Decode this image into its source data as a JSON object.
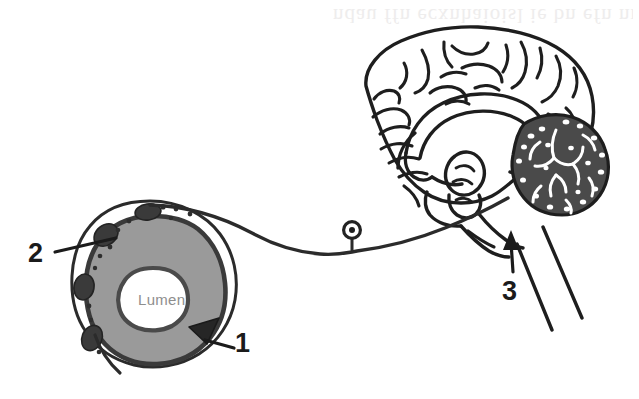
{
  "figure": {
    "type": "anatomical-line-diagram",
    "width": 639,
    "height": 399,
    "background_color": "#ffffff"
  },
  "labels": [
    {
      "id": "1",
      "text": "1",
      "refers_to": "parafollicular-cell-wedge-in-follicle-wall",
      "position": {
        "x": 235,
        "y": 330
      },
      "leader": "short line from dark triangular wedge at lower-right of follicle"
    },
    {
      "id": "2",
      "text": "2",
      "refers_to": "dark-cells-on-outer-follicle-membrane",
      "position": {
        "x": 28,
        "y": 240
      },
      "leader": "horizontal line to upper-left rim of follicle"
    },
    {
      "id": "3",
      "text": "3",
      "refers_to": "brainstem-axon-entry-point",
      "position": {
        "x": 502,
        "y": 278
      },
      "leader": "upward arrow to brainstem"
    }
  ],
  "follicle": {
    "lumen_label": "Lumen",
    "lumen_text_color": "#8e8e8e",
    "colloid_fill": "#9a9a9a",
    "lumen_fill": "#ffffff",
    "outline_color": "#2b2b2b",
    "dark_cell_fill": "#3a3a3a",
    "center": {
      "x": 152,
      "y": 297
    },
    "dark_cells_count": 4,
    "granule_dots_count": 11
  },
  "brain": {
    "outline_color": "#1e1e1e",
    "cerebellum_fill": "#4a4a4a",
    "view": "midsagittal section",
    "structures": [
      "cerebral cortex gyri",
      "corpus callosum",
      "thalamus",
      "midbrain",
      "cerebellum",
      "brainstem",
      "spinal cord"
    ]
  },
  "neuron": {
    "type": "pseudounipolar sensory neuron",
    "soma": {
      "x": 352,
      "y": 234,
      "radius": 7
    },
    "nucleus_fill": "#1e1e1e",
    "axon_color": "#2b2b2b",
    "description": "axon runs from thyroid follicle rightward to brainstem"
  },
  "artifacts": {
    "scan_bleedthrough_text": "ndau ffn ecxnhaioisl ie bn efn nri",
    "visible": true
  }
}
